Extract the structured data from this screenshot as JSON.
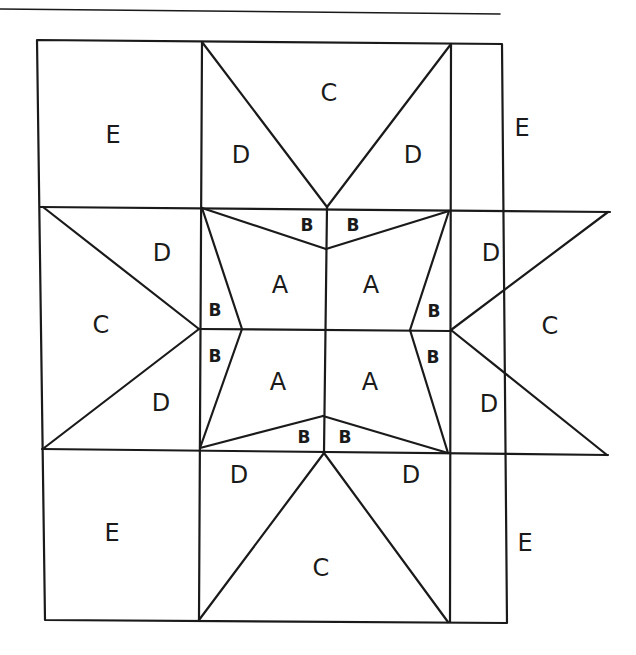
{
  "diagram": {
    "colors": {
      "line": "#1a1a1a",
      "background": "#ffffff"
    },
    "top_rule": {
      "x1": 0,
      "y1": 9,
      "x2": 500,
      "y2": 13
    },
    "labels": {
      "corner_tl": "E",
      "corner_tr": "E",
      "corner_bl": "E",
      "corner_br": "E",
      "top_c": "C",
      "top_d_left": "D",
      "top_d_right": "D",
      "left_c": "C",
      "left_d_top": "D",
      "left_d_bottom": "D",
      "right_c": "C",
      "right_d_top": "D",
      "right_d_bottom": "D",
      "bottom_c": "C",
      "bottom_d_left": "D",
      "bottom_d_right": "D",
      "center_a_tl": "A",
      "center_a_tr": "A",
      "center_a_bl": "A",
      "center_a_br": "A",
      "b_top_left": "B",
      "b_top_right": "B",
      "b_bottom_left": "B",
      "b_bottom_right": "B",
      "b_left_top": "B",
      "b_left_bottom": "B",
      "b_right_top": "B",
      "b_right_bottom": "B"
    },
    "pieces": [
      "A",
      "B",
      "C",
      "D",
      "E"
    ],
    "piece_counts": {
      "A": 4,
      "B": 8,
      "C": 4,
      "D": 8,
      "E": 4
    }
  }
}
